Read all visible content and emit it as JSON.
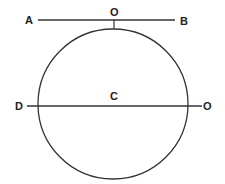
{
  "diagram": {
    "type": "geometry",
    "colors": {
      "stroke": "#333333",
      "label": "#222222",
      "background": "#ffffff"
    },
    "circle": {
      "center_label": "C",
      "cx": 113,
      "cy": 104,
      "r": 75
    },
    "tangent_line": {
      "start_label": "A",
      "end_label": "B",
      "point_label": "O",
      "y": 20,
      "x1": 38,
      "x2": 175
    },
    "diameter_line": {
      "start_label": "D",
      "end_label": "O",
      "y": 106,
      "x1": 27,
      "x2": 202
    },
    "labels": {
      "A": "A",
      "B": "B",
      "O_top": "O",
      "C": "C",
      "D": "D",
      "O_right": "O"
    }
  }
}
